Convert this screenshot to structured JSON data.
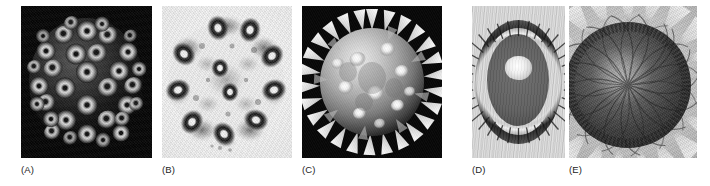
{
  "figure": {
    "background_color": "#ffffff",
    "width": 710,
    "height": 186,
    "layout": "single row of five grayscale micrograph / photograph panels with lettered captions beneath",
    "panels": [
      {
        "id": "a",
        "label": "(A)",
        "subject": "icosahedral virus capsid",
        "description": "cryo-electron-microscopy reconstruction of a spherical virus capsid made of ring-shaped capsomeres arranged on a black background",
        "background_color": "#050505",
        "foreground_color": "#d8d8d8",
        "shape": "sphere of donut-shaped capsomere subunits",
        "capsomere_count": 33,
        "image_type": "electron micrograph",
        "rect": {
          "x": 21,
          "y": 6,
          "w": 131,
          "h": 152
        },
        "label_pos": {
          "x": 21,
          "y": 165
        }
      },
      {
        "id": "b",
        "label": "(B)",
        "subject": "axoneme cross-section",
        "description": "transmission electron micrograph of a flagellum cross-section showing nine outer microtubule doublets around a central pair, dark stain on a pale background",
        "background_color": "#f6f6f6",
        "foreground_color": "#1c1c1c",
        "shape": "ring of nine dark doublets with a central pair",
        "outer_doublets": 9,
        "central_pair": 2,
        "image_type": "transmission electron micrograph",
        "rect": {
          "x": 162,
          "y": 6,
          "w": 130,
          "h": 152
        },
        "label_pos": {
          "x": 162,
          "y": 165
        }
      },
      {
        "id": "c",
        "label": "(C)",
        "subject": "pollen grain",
        "description": "scanning electron micrograph of a spiny spherical pollen grain with conical spikes and bright rounded knobs on a black background",
        "background_color": "#070707",
        "foreground_color": "#d2d2d2",
        "shape": "spiny sphere",
        "spike_count": 26,
        "image_type": "scanning electron micrograph",
        "rect": {
          "x": 302,
          "y": 6,
          "w": 140,
          "h": 152
        },
        "label_pos": {
          "x": 302,
          "y": 165
        }
      },
      {
        "id": "d",
        "label": "(D)",
        "subject": "spiny cactus viewed from above",
        "description": "grayscale photograph of a barrel cactus from above, a dark concentric ring of spines surrounding a bright woolly centre on a pale striated ground",
        "background_color": "#d4d4d4",
        "foreground_color": "#4f4f4f",
        "shape": "concentric rings around a bright core",
        "ring_count": 3,
        "image_type": "photograph",
        "rect": {
          "x": 472,
          "y": 6,
          "w": 93,
          "h": 152
        },
        "label_pos": {
          "x": 472,
          "y": 165
        }
      },
      {
        "id": "e",
        "label": "(E)",
        "subject": "sunflower head",
        "description": "grayscale photograph of a sunflower capitulum showing the spiral phyllotactic packing of florets in the dark disc, ringed by light radiating ray petals",
        "background_color": "#c8c8c8",
        "foreground_color": "#303030",
        "shape": "disc of spiral-packed florets surrounded by ray petals",
        "spiral_arms": 34,
        "image_type": "photograph",
        "rect": {
          "x": 569,
          "y": 6,
          "w": 128,
          "h": 152
        },
        "label_pos": {
          "x": 569,
          "y": 165
        }
      }
    ]
  }
}
